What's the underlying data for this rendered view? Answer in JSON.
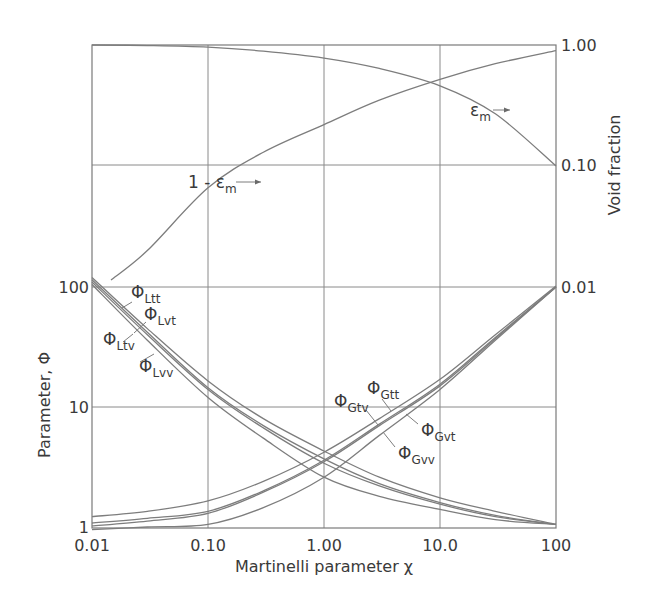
{
  "chart_data": {
    "type": "line",
    "title": "",
    "xlabel": "Martinelli parameter χ",
    "ylabel": "Parameter, Φ",
    "y2label": "Void fraction",
    "xscale": "log",
    "yscale": "log",
    "y2scale": "log",
    "xlim": [
      0.01,
      100
    ],
    "ylim": [
      0.9,
      1000
    ],
    "y2lim": [
      0.001,
      1.0
    ],
    "grid": true,
    "legend": "inline labels with leader lines",
    "x_ticks": [
      "0.01",
      "0.10",
      "1.00",
      "10.0",
      "100"
    ],
    "y_ticks": [
      "1",
      "10",
      "100"
    ],
    "y2_ticks": [
      "1.00",
      "0.10",
      "0.01"
    ],
    "x": [
      0.01,
      0.03,
      0.1,
      0.3,
      1.0,
      3.0,
      10.0,
      30.0,
      100.0
    ],
    "series": [
      {
        "name": "ΦLtt",
        "label_main": "Φ",
        "label_sub": "Ltt",
        "axis": "left",
        "values": [
          120,
          45,
          16.5,
          8.0,
          4.3,
          2.6,
          1.75,
          1.35,
          1.05
        ]
      },
      {
        "name": "ΦLvt",
        "label_main": "Φ",
        "label_sub": "Lvt",
        "axis": "left",
        "values": [
          115,
          42,
          14.5,
          7.0,
          3.7,
          2.3,
          1.6,
          1.25,
          1.05
        ]
      },
      {
        "name": "ΦLtv",
        "label_main": "Φ",
        "label_sub": "Ltv",
        "axis": "left",
        "values": [
          110,
          40,
          14.0,
          6.7,
          3.4,
          2.2,
          1.55,
          1.22,
          1.05
        ]
      },
      {
        "name": "ΦLvv",
        "label_main": "Φ",
        "label_sub": "Lvv",
        "axis": "left",
        "values": [
          105,
          36,
          12.0,
          5.5,
          2.6,
          1.8,
          1.4,
          1.15,
          1.05
        ]
      },
      {
        "name": "ΦGtt",
        "label_main": "Φ",
        "label_sub": "Gtt",
        "axis": "left",
        "values": [
          1.22,
          1.35,
          1.65,
          2.4,
          4.2,
          8.0,
          17.0,
          40,
          102
        ]
      },
      {
        "name": "ΦGvt",
        "label_main": "Φ",
        "label_sub": "Gvt",
        "axis": "left",
        "values": [
          1.08,
          1.18,
          1.35,
          2.0,
          3.6,
          7.2,
          15.5,
          38,
          100
        ]
      },
      {
        "name": "ΦGtv",
        "label_main": "Φ",
        "label_sub": "Gtv",
        "axis": "left",
        "values": [
          1.02,
          1.12,
          1.3,
          1.95,
          3.5,
          7.0,
          15.0,
          37,
          100
        ]
      },
      {
        "name": "ΦGvv",
        "label_main": "Φ",
        "label_sub": "Gvv",
        "axis": "left",
        "values": [
          0.95,
          1.0,
          1.05,
          1.45,
          2.6,
          5.8,
          14.0,
          36,
          100
        ]
      },
      {
        "name": "εm",
        "label_main": "ε",
        "label_sub": "m",
        "axis": "right",
        "values": [
          1.0,
          0.99,
          0.96,
          0.89,
          0.78,
          0.64,
          0.46,
          0.27,
          0.1
        ]
      },
      {
        "name": "1 - εm",
        "label_main": "1 - ε",
        "label_sub": "m",
        "axis": "right",
        "values": [
          null,
          0.02,
          0.066,
          0.13,
          0.22,
          0.35,
          0.52,
          0.7,
          0.9
        ]
      }
    ],
    "annotations": [
      {
        "text": "εm →",
        "points_to": "right axis"
      },
      {
        "text": "1 - εm →",
        "points_to": "right axis"
      }
    ]
  }
}
